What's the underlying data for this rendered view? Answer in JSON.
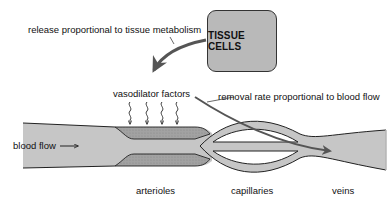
{
  "diagram": {
    "tissue_box": {
      "label": "TISSUE CELLS",
      "fill": "#b9b9b9",
      "border": "#333333"
    },
    "annotations": {
      "release": "release proportional to tissue metabolism",
      "vasodilator": "vasodilator factors",
      "removal": "removal rate proportional to blood flow",
      "blood_flow": "blood flow"
    },
    "vessel_labels": {
      "arterioles": "arterioles",
      "capillaries": "capillaries",
      "veins": "veins"
    },
    "colors": {
      "vessel_fill": "#c6c6c6",
      "arteriole_wall": "#9a9a9a",
      "outline": "#222222",
      "arrow": "#555555",
      "background": "#ffffff"
    },
    "vasodilator_arrow_count": 4
  }
}
